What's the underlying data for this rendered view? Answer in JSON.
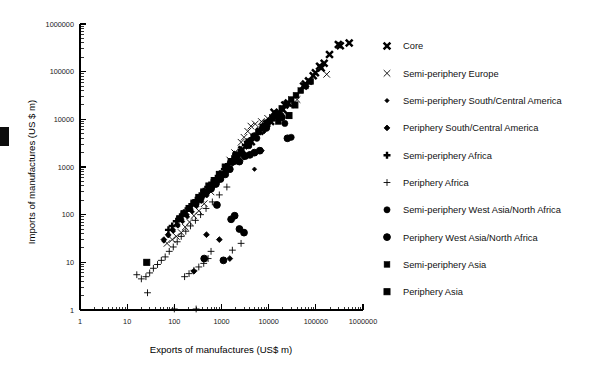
{
  "figure": {
    "background": "#ffffff",
    "ink_color": "#000000"
  },
  "axes": {
    "x": {
      "title": "Exports of manufactures (US$ m)",
      "scale": "log",
      "ticks": [
        "1",
        "10",
        "100",
        "1000",
        "10000",
        "100000",
        "1000000"
      ],
      "min": 1,
      "max": 1000000
    },
    "y": {
      "title": "Imports of manufactures (US $ m)",
      "scale": "log",
      "ticks": [
        "1",
        "10",
        "100",
        "1000",
        "10000",
        "100000",
        "1000000"
      ],
      "min": 1,
      "max": 1000000
    }
  },
  "legend": {
    "position": "right",
    "items": [
      {
        "label": "Core",
        "marker": "heavy-x-icon"
      },
      {
        "label": "Semi-periphery Europe",
        "marker": "light-x-icon"
      },
      {
        "label": "Semi-periphery South/Central America",
        "marker": "small-filled-diamond-icon"
      },
      {
        "label": "Periphery South/Central America",
        "marker": "open-diamond-icon"
      },
      {
        "label": "Semi-periphery Africa",
        "marker": "bold-plus-icon"
      },
      {
        "label": "Periphery Africa",
        "marker": "thin-plus-icon"
      },
      {
        "label": "Semi-periphery West Asia/North Africa",
        "marker": "filled-circle-icon"
      },
      {
        "label": "Periphery West Asia/North Africa",
        "marker": "open-circle-icon"
      },
      {
        "label": "Semi-periphery Asia",
        "marker": "filled-square-icon"
      },
      {
        "label": "Periphery Asia",
        "marker": "open-square-icon"
      }
    ]
  },
  "chart_data": {
    "type": "scatter",
    "title": "",
    "xlabel": "Exports of manufactures (US$ m)",
    "ylabel": "Imports of manufactures (US $ m)",
    "xscale": "log",
    "yscale": "log",
    "xlim": [
      1,
      1000000
    ],
    "ylim": [
      1,
      1000000
    ],
    "grid": false,
    "legend_position": "right",
    "series": [
      {
        "name": "Core",
        "marker": "heavy-x-icon",
        "points": [
          [
            510000,
            400000
          ],
          [
            300000,
            370000
          ],
          [
            195000,
            230000
          ],
          [
            330000,
            350000
          ],
          [
            150000,
            150000
          ],
          [
            130000,
            120000
          ],
          [
            120000,
            130000
          ],
          [
            98000,
            95000
          ],
          [
            88000,
            82000
          ],
          [
            70000,
            64000
          ],
          [
            60000,
            55000
          ],
          [
            55000,
            50000
          ],
          [
            26000,
            22000
          ],
          [
            22000,
            20000
          ],
          [
            20000,
            16000
          ],
          [
            14000,
            11000
          ],
          [
            13000,
            14000
          ],
          [
            11000,
            9000
          ],
          [
            9000,
            8000
          ],
          [
            7800,
            6800
          ],
          [
            6500,
            5600
          ],
          [
            5200,
            4300
          ],
          [
            4300,
            3400
          ],
          [
            3600,
            3000
          ],
          [
            2700,
            2300
          ],
          [
            2100,
            1800
          ]
        ]
      },
      {
        "name": "Semi-periphery Europe",
        "marker": "light-x-icon",
        "points": [
          [
            170000,
            88000
          ],
          [
            40000,
            26000
          ],
          [
            28000,
            20000
          ],
          [
            17000,
            14000
          ],
          [
            12000,
            11000
          ],
          [
            9500,
            10500
          ],
          [
            7000,
            9000
          ],
          [
            5200,
            8000
          ],
          [
            4200,
            7200
          ],
          [
            3600,
            5600
          ],
          [
            3000,
            4200
          ],
          [
            2600,
            3300
          ],
          [
            1900,
            2000
          ],
          [
            1500,
            1400
          ],
          [
            1200,
            900
          ],
          [
            900,
            600
          ],
          [
            600,
            300
          ],
          [
            430,
            170
          ],
          [
            330,
            120
          ],
          [
            260,
            95
          ],
          [
            210,
            70
          ],
          [
            170,
            55
          ],
          [
            140,
            42
          ],
          [
            110,
            35
          ],
          [
            90,
            30
          ],
          [
            70,
            25
          ]
        ]
      },
      {
        "name": "Semi-periphery South/Central America",
        "marker": "small-filled-diamond-icon",
        "points": [
          [
            19000,
            13000
          ],
          [
            11000,
            8800
          ],
          [
            8000,
            5500
          ],
          [
            5800,
            4200
          ],
          [
            4300,
            3200
          ],
          [
            3400,
            2600
          ],
          [
            2700,
            2000
          ],
          [
            2100,
            1500
          ],
          [
            1700,
            1150
          ],
          [
            1300,
            800
          ],
          [
            1000,
            600
          ],
          [
            800,
            430
          ],
          [
            620,
            330
          ],
          [
            490,
            250
          ],
          [
            380,
            190
          ],
          [
            300,
            150
          ],
          [
            240,
            115
          ],
          [
            190,
            90
          ],
          [
            150,
            72
          ],
          [
            120,
            58
          ],
          [
            95,
            45
          ],
          [
            75,
            36
          ],
          [
            60,
            28
          ],
          [
            5000,
            900
          ]
        ]
      },
      {
        "name": "Periphery South/Central America",
        "marker": "open-diamond-icon",
        "points": [
          [
            7000,
            2200
          ],
          [
            3000,
            1600
          ],
          [
            1800,
            1250
          ],
          [
            1200,
            800
          ],
          [
            900,
            560
          ],
          [
            700,
            420
          ],
          [
            560,
            330
          ],
          [
            440,
            260
          ],
          [
            350,
            200
          ],
          [
            280,
            160
          ],
          [
            220,
            130
          ],
          [
            180,
            100
          ],
          [
            140,
            80
          ],
          [
            115,
            62
          ],
          [
            92,
            48
          ],
          [
            74,
            38
          ],
          [
            60,
            30
          ],
          [
            480,
            38
          ],
          [
            900,
            30
          ],
          [
            1500,
            12
          ],
          [
            260,
            6.5
          ]
        ]
      },
      {
        "name": "Semi-periphery Africa",
        "marker": "bold-plus-icon",
        "points": [
          [
            6500,
            6000
          ],
          [
            5000,
            4500
          ],
          [
            4000,
            3600
          ],
          [
            3200,
            2900
          ],
          [
            2600,
            2300
          ],
          [
            2100,
            1800
          ],
          [
            1700,
            1450
          ],
          [
            1400,
            1150
          ],
          [
            1150,
            900
          ],
          [
            930,
            720
          ],
          [
            760,
            580
          ],
          [
            620,
            470
          ],
          [
            510,
            380
          ],
          [
            420,
            310
          ],
          [
            345,
            250
          ],
          [
            285,
            200
          ],
          [
            235,
            165
          ],
          [
            195,
            135
          ],
          [
            160,
            110
          ],
          [
            132,
            90
          ],
          [
            110,
            73
          ],
          [
            90,
            58
          ],
          [
            75,
            48
          ],
          [
            8500,
            8000
          ],
          [
            11000,
            10000
          ],
          [
            14000,
            13000
          ]
        ]
      },
      {
        "name": "Periphery Africa",
        "marker": "thin-plus-icon",
        "points": [
          [
            1300,
            380
          ],
          [
            900,
            260
          ],
          [
            640,
            185
          ],
          [
            470,
            135
          ],
          [
            360,
            100
          ],
          [
            280,
            76
          ],
          [
            220,
            58
          ],
          [
            175,
            45
          ],
          [
            140,
            35
          ],
          [
            115,
            27
          ],
          [
            95,
            21
          ],
          [
            78,
            17
          ],
          [
            64,
            13
          ],
          [
            53,
            11
          ],
          [
            44,
            9
          ],
          [
            36,
            7.5
          ],
          [
            30,
            6
          ],
          [
            25,
            5
          ],
          [
            20,
            4.5
          ],
          [
            16,
            5.5
          ],
          [
            27,
            2.3
          ],
          [
            100,
            1.05
          ],
          [
            290,
            1.05
          ],
          [
            600,
            17
          ],
          [
            420,
            9.5
          ],
          [
            330,
            8
          ],
          [
            260,
            6.8
          ],
          [
            205,
            5.8
          ],
          [
            165,
            5
          ],
          [
            520,
            12
          ],
          [
            1700,
            18
          ],
          [
            2600,
            25
          ]
        ]
      },
      {
        "name": "Semi-periphery West Asia/North Africa",
        "marker": "filled-circle-icon",
        "points": [
          [
            22000,
            8200
          ],
          [
            30000,
            4200
          ],
          [
            9000,
            6500
          ],
          [
            5600,
            4000
          ],
          [
            3800,
            2800
          ],
          [
            2600,
            1900
          ],
          [
            1900,
            1300
          ],
          [
            1400,
            950
          ],
          [
            1050,
            680
          ],
          [
            800,
            500
          ],
          [
            620,
            380
          ],
          [
            480,
            290
          ],
          [
            370,
            220
          ],
          [
            290,
            170
          ]
        ]
      },
      {
        "name": "Periphery West Asia/North Africa",
        "marker": "open-circle-icon",
        "points": [
          [
            25000,
            4000
          ],
          [
            6500,
            2200
          ],
          [
            5000,
            2000
          ],
          [
            4000,
            1800
          ],
          [
            3200,
            1700
          ],
          [
            2400,
            1300
          ],
          [
            1500,
            900
          ],
          [
            1200,
            700
          ],
          [
            950,
            560
          ],
          [
            760,
            440
          ],
          [
            600,
            350
          ],
          [
            1900,
            95
          ],
          [
            1600,
            80
          ],
          [
            3000,
            42
          ],
          [
            2400,
            50
          ],
          [
            1100,
            11
          ],
          [
            800,
            160
          ],
          [
            430,
            12
          ],
          [
            16000,
            12000
          ],
          [
            19000,
            11000
          ]
        ]
      },
      {
        "name": "Semi-periphery Asia",
        "marker": "filled-square-icon",
        "points": [
          [
            78000,
            62000
          ],
          [
            60000,
            50000
          ],
          [
            48000,
            40000
          ],
          [
            38000,
            32000
          ],
          [
            30000,
            26000
          ],
          [
            24000,
            21000
          ],
          [
            19000,
            17000
          ],
          [
            15000,
            13500
          ],
          [
            12000,
            10500
          ],
          [
            9500,
            8500
          ],
          [
            7500,
            6800
          ],
          [
            6000,
            5400
          ],
          [
            4800,
            4300
          ],
          [
            3800,
            3400
          ],
          [
            9000,
            7000
          ],
          [
            16000,
            9000
          ]
        ]
      },
      {
        "name": "Periphery Asia",
        "marker": "open-square-icon",
        "points": [
          [
            27000,
            12000
          ],
          [
            36000,
            20000
          ],
          [
            1200,
            1000
          ],
          [
            900,
            700
          ],
          [
            700,
            520
          ],
          [
            540,
            400
          ],
          [
            420,
            300
          ],
          [
            330,
            230
          ],
          [
            260,
            175
          ],
          [
            205,
            135
          ],
          [
            160,
            105
          ],
          [
            130,
            82
          ],
          [
            26,
            10
          ],
          [
            2000,
            1700
          ],
          [
            1600,
            1300
          ]
        ]
      }
    ]
  }
}
